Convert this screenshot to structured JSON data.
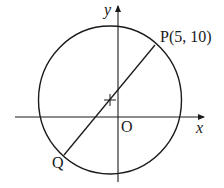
{
  "diagram": {
    "axes": {
      "x_label": "x",
      "y_label": "y",
      "origin_label": "O"
    },
    "points": {
      "P": {
        "label": "P(5, 10)",
        "x": 5,
        "y": 10
      },
      "Q": {
        "label": "Q"
      }
    },
    "elements": [
      "circle",
      "diameter PQ through center",
      "center marker (+)"
    ],
    "colors": {
      "stroke": "#1a1a1a",
      "background": "#ffffff"
    }
  }
}
